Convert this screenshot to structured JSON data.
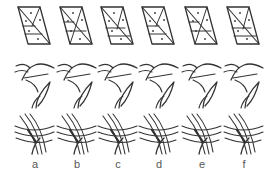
{
  "figure": {
    "rows": [
      "parallelogram-subdivision",
      "arc-curves",
      "crossing-curve-bundle"
    ],
    "columns": [
      {
        "label": "a"
      },
      {
        "label": "b"
      },
      {
        "label": "c"
      },
      {
        "label": "d"
      },
      {
        "label": "e"
      },
      {
        "label": "f"
      }
    ],
    "colors": {
      "stroke": "#333333",
      "label": "#555555",
      "background": "#ffffff"
    }
  }
}
